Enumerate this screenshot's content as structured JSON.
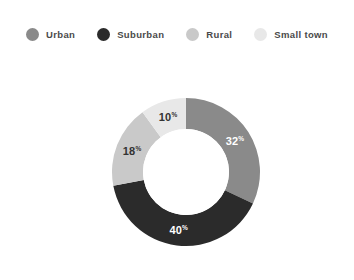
{
  "chart_data": {
    "type": "pie",
    "variant": "donut",
    "title": "",
    "subtitle": "",
    "xlabel": "",
    "ylabel": "",
    "grid": false,
    "legend_position": "top",
    "legend_orientation": "horizontal",
    "value_suffix": "%",
    "start_angle_deg": 0,
    "direction": "clockwise",
    "categories": [
      "Urban",
      "Suburban",
      "Rural",
      "Small town"
    ],
    "values": [
      32,
      40,
      18,
      10
    ],
    "data_labels": [
      "32%",
      "40%",
      "18%",
      "10%"
    ],
    "colors": [
      "#8a8a8a",
      "#2b2b2b",
      "#c9c9c9",
      "#e8e8e8"
    ],
    "label_colors": [
      "#ffffff",
      "#ffffff",
      "#333333",
      "#333333"
    ],
    "slices": [
      {
        "name": "Urban",
        "value": 32,
        "label": "32",
        "suffix": "%",
        "color": "#8a8a8a",
        "label_color": "#ffffff"
      },
      {
        "name": "Suburban",
        "value": 40,
        "label": "40",
        "suffix": "%",
        "color": "#2b2b2b",
        "label_color": "#ffffff"
      },
      {
        "name": "Rural",
        "value": 18,
        "label": "18",
        "suffix": "%",
        "color": "#c9c9c9",
        "label_color": "#333333"
      },
      {
        "name": "Small town",
        "value": 10,
        "label": "10",
        "suffix": "%",
        "color": "#e8e8e8",
        "label_color": "#333333"
      }
    ]
  },
  "legend": {
    "items": [
      {
        "label": "Urban",
        "color": "#8a8a8a"
      },
      {
        "label": "Suburban",
        "color": "#2b2b2b"
      },
      {
        "label": "Rural",
        "color": "#c9c9c9"
      },
      {
        "label": "Small town",
        "color": "#e8e8e8"
      }
    ]
  },
  "geometry": {
    "center_x": 75,
    "center_y": 75,
    "outer_radius": 74,
    "inner_radius": 43,
    "label_radius": 58
  },
  "colors": {
    "background": "#ffffff",
    "hole": "#ffffff",
    "legend_text": "#4a4a4a"
  }
}
